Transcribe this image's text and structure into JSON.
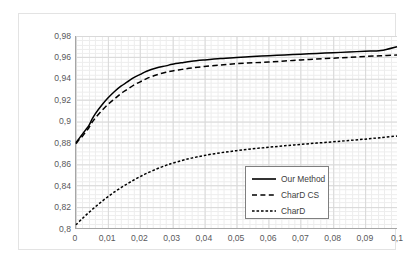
{
  "chart_data": {
    "type": "line",
    "title": "",
    "subtitle": "",
    "xlabel": "",
    "ylabel": "",
    "xlim": [
      0,
      0.1
    ],
    "ylim": [
      0.8,
      0.98
    ],
    "grid": true,
    "minor_grid": true,
    "legend_position": "inside-center-right",
    "x_tick_labels": [
      "0",
      "0,01",
      "0,02",
      "0,03",
      "0,04",
      "0,05",
      "0,06",
      "0,07",
      "0,08",
      "0,09",
      "0,1"
    ],
    "x_tick_values": [
      0,
      0.01,
      0.02,
      0.03,
      0.04,
      0.05,
      0.06,
      0.07,
      0.08,
      0.09,
      0.1
    ],
    "y_tick_labels": [
      "0,8",
      "0,82",
      "0,84",
      "0,86",
      "0,88",
      "0,9",
      "0,92",
      "0,94",
      "0,96",
      "0,98"
    ],
    "y_tick_values": [
      0.8,
      0.82,
      0.84,
      0.86,
      0.88,
      0.9,
      0.92,
      0.94,
      0.96,
      0.98
    ],
    "series": [
      {
        "name": "Our Method",
        "style": "solid",
        "color": "#000000",
        "x": [
          0,
          0.001,
          0.002,
          0.003,
          0.004,
          0.005,
          0.006,
          0.008,
          0.01,
          0.012,
          0.014,
          0.016,
          0.018,
          0.02,
          0.022,
          0.025,
          0.028,
          0.03,
          0.033,
          0.036,
          0.04,
          0.045,
          0.05,
          0.055,
          0.06,
          0.065,
          0.07,
          0.075,
          0.08,
          0.085,
          0.09,
          0.095,
          0.1
        ],
        "y": [
          0.88,
          0.884,
          0.888,
          0.892,
          0.896,
          0.902,
          0.907,
          0.915,
          0.922,
          0.928,
          0.933,
          0.937,
          0.941,
          0.944,
          0.947,
          0.95,
          0.952,
          0.9535,
          0.955,
          0.9563,
          0.9575,
          0.9588,
          0.9598,
          0.9607,
          0.9615,
          0.9622,
          0.9629,
          0.9636,
          0.9643,
          0.965,
          0.9657,
          0.9664,
          0.97
        ]
      },
      {
        "name": "CharD CS",
        "style": "dashed",
        "color": "#000000",
        "x": [
          0,
          0.001,
          0.002,
          0.003,
          0.004,
          0.005,
          0.006,
          0.008,
          0.01,
          0.012,
          0.014,
          0.016,
          0.018,
          0.02,
          0.022,
          0.025,
          0.028,
          0.03,
          0.033,
          0.036,
          0.04,
          0.045,
          0.05,
          0.055,
          0.06,
          0.065,
          0.07,
          0.075,
          0.08,
          0.085,
          0.09,
          0.095,
          0.1
        ],
        "y": [
          0.879,
          0.883,
          0.886,
          0.89,
          0.894,
          0.899,
          0.903,
          0.91,
          0.916,
          0.921,
          0.926,
          0.93,
          0.934,
          0.937,
          0.94,
          0.9435,
          0.946,
          0.9472,
          0.9487,
          0.95,
          0.9514,
          0.9528,
          0.954,
          0.9549,
          0.9556,
          0.9566,
          0.9575,
          0.9584,
          0.9592,
          0.96,
          0.9608,
          0.9615,
          0.9622
        ]
      },
      {
        "name": "CharD",
        "style": "dotted",
        "color": "#000000",
        "x": [
          0,
          0.002,
          0.004,
          0.006,
          0.008,
          0.01,
          0.012,
          0.014,
          0.016,
          0.018,
          0.02,
          0.022,
          0.025,
          0.028,
          0.03,
          0.033,
          0.036,
          0.04,
          0.045,
          0.05,
          0.055,
          0.06,
          0.065,
          0.07,
          0.075,
          0.08,
          0.085,
          0.09,
          0.095,
          0.1
        ],
        "y": [
          0.803,
          0.809,
          0.8145,
          0.8198,
          0.8248,
          0.8295,
          0.8338,
          0.8378,
          0.8415,
          0.845,
          0.8482,
          0.8512,
          0.8552,
          0.8587,
          0.8607,
          0.8633,
          0.8655,
          0.868,
          0.8705,
          0.8725,
          0.8742,
          0.8757,
          0.8771,
          0.8784,
          0.8796,
          0.8808,
          0.882,
          0.8833,
          0.8847,
          0.8862
        ]
      }
    ]
  },
  "legend": {
    "items": [
      {
        "label": "Our Method",
        "dash": "none"
      },
      {
        "label": "CharD CS",
        "dash": "6,3"
      },
      {
        "label": "CharD",
        "dash": "2.5,2"
      }
    ]
  },
  "colors": {
    "series": "#000000",
    "major_grid": "#d9d9d9",
    "minor_grid": "#ededed",
    "axis": "#a6a6a6",
    "tick_text": "#59595b",
    "legend_border": "#7f7f7f",
    "frame_border": "#e3e3e3",
    "background": "#ffffff"
  }
}
